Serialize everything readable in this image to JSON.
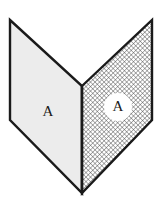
{
  "figure": {
    "canvas": {
      "width": 165,
      "height": 202,
      "background_color": "#ffffff"
    },
    "colors": {
      "outline": "#1a1a1a",
      "left_panel_fill": "#ececec",
      "right_panel_fill": "#ffffff",
      "hatch_stroke": "#555555",
      "label_color": "#1a1a1a",
      "halo_fill": "#ffffff"
    },
    "panels": [
      {
        "id": "left-panel",
        "label": "A",
        "fill_style": "solid-light-gray",
        "points": "10,20 82,86 82,193 10,120",
        "label_x": 48,
        "label_y": 113,
        "halo": false
      },
      {
        "id": "right-panel",
        "label": "A",
        "fill_style": "cross-hatch",
        "points": "82,86 152,20 152,120 82,193",
        "label_x": 118,
        "label_y": 107,
        "halo": true,
        "halo_cx": 118,
        "halo_cy": 107,
        "halo_r": 14
      }
    ],
    "fold": {
      "id": "center-fold",
      "x1": 82,
      "y1": 86,
      "x2": 82,
      "y2": 193
    },
    "outline_width": 2.4,
    "hatch": {
      "spacing": 3.2,
      "stroke_width": 0.8
    }
  }
}
